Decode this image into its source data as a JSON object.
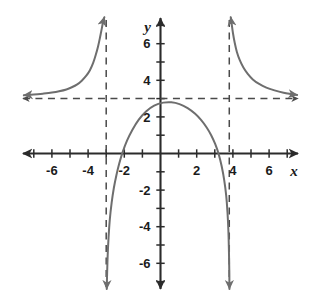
{
  "figure": {
    "title": "",
    "background_color": "#ffffff",
    "curve_color": "#6e6e6e",
    "axis_color": "#2b2b2b",
    "asymptote_color": "#4a4a4a",
    "label_color": "#1b1b1b"
  },
  "axes": {
    "x_name": "x",
    "y_name": "y",
    "x_tick_labels": [
      "-6",
      "-4",
      "-2",
      "2",
      "4",
      "6"
    ],
    "y_tick_labels": [
      "6",
      "4",
      "2",
      "-2",
      "-4",
      "-6"
    ]
  },
  "chart_data": {
    "type": "line",
    "title": "",
    "xlabel": "x",
    "ylabel": "y",
    "xlim": [
      -7.6,
      7.6
    ],
    "ylim": [
      -7.4,
      7.4
    ],
    "grid": false,
    "legend": "none",
    "x_ticks": [
      -7,
      -6,
      -5,
      -4,
      -3,
      -2,
      -1,
      1,
      2,
      3,
      4,
      5,
      6,
      7
    ],
    "x_tick_labels": [
      {
        "value": -6,
        "label": "-6"
      },
      {
        "value": -4,
        "label": "-4"
      },
      {
        "value": -2,
        "label": "-2"
      },
      {
        "value": 2,
        "label": "2"
      },
      {
        "value": 4,
        "label": "4"
      },
      {
        "value": 6,
        "label": "6"
      }
    ],
    "y_ticks": [
      -7,
      -6,
      -5,
      -4,
      -3,
      -2,
      -1,
      1,
      2,
      3,
      4,
      5,
      6,
      7
    ],
    "y_tick_labels": [
      {
        "value": 6,
        "label": "6"
      },
      {
        "value": 4,
        "label": "4"
      },
      {
        "value": 2,
        "label": "2"
      },
      {
        "value": -2,
        "label": "-2"
      },
      {
        "value": -4,
        "label": "-4"
      },
      {
        "value": -6,
        "label": "-6"
      }
    ],
    "asymptotes": [
      {
        "kind": "vertical",
        "value": -3.0,
        "style": "dashed"
      },
      {
        "kind": "vertical",
        "value": 3.8,
        "style": "dashed"
      },
      {
        "kind": "horizontal",
        "value": 3.0,
        "style": "dashed"
      }
    ],
    "annotations": [
      {
        "text": "vertical asymptote at x = -3"
      },
      {
        "text": "vertical asymptote at x = 3.8"
      },
      {
        "text": "horizontal asymptote at y = 3"
      }
    ],
    "series": [
      {
        "name": "left-branch",
        "arrow_start": true,
        "arrow_end": true,
        "points": [
          [
            -7.55,
            3.18
          ],
          [
            -7.0,
            3.22
          ],
          [
            -6.5,
            3.27
          ],
          [
            -6.0,
            3.33
          ],
          [
            -5.6,
            3.4
          ],
          [
            -5.2,
            3.5
          ],
          [
            -4.9,
            3.62
          ],
          [
            -4.6,
            3.78
          ],
          [
            -4.35,
            3.98
          ],
          [
            -4.1,
            4.25
          ],
          [
            -3.9,
            4.55
          ],
          [
            -3.72,
            4.95
          ],
          [
            -3.58,
            5.38
          ],
          [
            -3.45,
            5.85
          ],
          [
            -3.34,
            6.35
          ],
          [
            -3.24,
            6.85
          ],
          [
            -3.16,
            7.25
          ],
          [
            -3.1,
            7.45
          ]
        ]
      },
      {
        "name": "middle-branch",
        "arrow_start": true,
        "arrow_end": true,
        "points": [
          [
            -2.97,
            -7.4
          ],
          [
            -2.95,
            -6.6
          ],
          [
            -2.92,
            -5.6
          ],
          [
            -2.87,
            -4.6
          ],
          [
            -2.8,
            -3.6
          ],
          [
            -2.7,
            -2.7
          ],
          [
            -2.58,
            -1.9
          ],
          [
            -2.44,
            -1.2
          ],
          [
            -2.28,
            -0.55
          ],
          [
            -2.1,
            0.05
          ],
          [
            -1.85,
            0.7
          ],
          [
            -1.55,
            1.3
          ],
          [
            -1.2,
            1.85
          ],
          [
            -0.8,
            2.3
          ],
          [
            -0.35,
            2.62
          ],
          [
            0.15,
            2.78
          ],
          [
            0.6,
            2.8
          ],
          [
            1.05,
            2.7
          ],
          [
            1.5,
            2.48
          ],
          [
            1.9,
            2.18
          ],
          [
            2.25,
            1.82
          ],
          [
            2.55,
            1.42
          ],
          [
            2.8,
            1.0
          ],
          [
            3.02,
            0.52
          ],
          [
            3.22,
            -0.05
          ],
          [
            3.38,
            -0.7
          ],
          [
            3.52,
            -1.45
          ],
          [
            3.63,
            -2.3
          ],
          [
            3.7,
            -3.2
          ],
          [
            3.75,
            -4.2
          ],
          [
            3.78,
            -5.3
          ],
          [
            3.8,
            -6.4
          ],
          [
            3.81,
            -7.4
          ]
        ]
      },
      {
        "name": "right-branch",
        "arrow_start": true,
        "arrow_end": true,
        "points": [
          [
            3.88,
            7.45
          ],
          [
            3.93,
            7.1
          ],
          [
            4.0,
            6.6
          ],
          [
            4.1,
            6.05
          ],
          [
            4.22,
            5.55
          ],
          [
            4.38,
            5.1
          ],
          [
            4.58,
            4.7
          ],
          [
            4.82,
            4.35
          ],
          [
            5.1,
            4.05
          ],
          [
            5.45,
            3.8
          ],
          [
            5.85,
            3.6
          ],
          [
            6.3,
            3.45
          ],
          [
            6.8,
            3.32
          ],
          [
            7.2,
            3.25
          ],
          [
            7.55,
            3.2
          ]
        ]
      }
    ]
  }
}
